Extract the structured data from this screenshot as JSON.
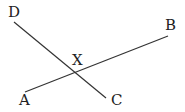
{
  "diagram": {
    "type": "intersecting-lines",
    "line_color": "#333333",
    "label_color": "#222222",
    "lines": [
      {
        "name": "AB",
        "from": "A",
        "to": "B",
        "x1": 25,
        "y1": 92,
        "x2": 168,
        "y2": 36
      },
      {
        "name": "DC",
        "from": "D",
        "to": "C",
        "x1": 14,
        "y1": 22,
        "x2": 106,
        "y2": 98
      }
    ],
    "labels": {
      "A": "A",
      "B": "B",
      "C": "C",
      "D": "D",
      "X": "X"
    },
    "intersection": {
      "label": "X",
      "x": 75,
      "y": 73
    }
  }
}
